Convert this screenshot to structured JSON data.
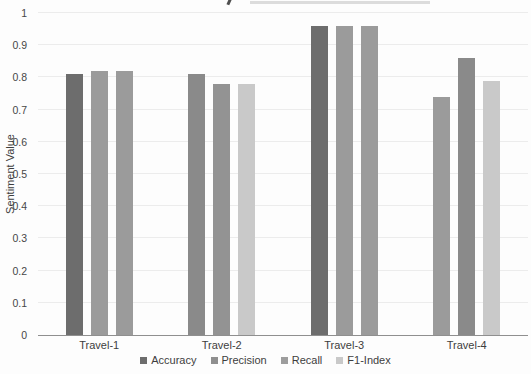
{
  "chart_data": {
    "type": "bar",
    "title": "",
    "title_note": "title cropped out of frame at top edge",
    "ylabel": "Sentiment Value",
    "xlabel": "",
    "ylim": [
      0,
      1
    ],
    "yticks": [
      0,
      0.1,
      0.2,
      0.3,
      0.4,
      0.5,
      0.6,
      0.7,
      0.8,
      0.9,
      1
    ],
    "grid": true,
    "legend_position": "bottom",
    "categories": [
      "Travel-1",
      "Travel-2",
      "Travel-3",
      "Travel-4"
    ],
    "series": [
      {
        "name": "Accuracy",
        "color": "#6d6d6d"
      },
      {
        "name": "Precision",
        "color": "#8f8f8f"
      },
      {
        "name": "Recall",
        "color": "#9d9d9d"
      },
      {
        "name": "F1-Index",
        "color": "#c9c9c9"
      }
    ],
    "groups": [
      {
        "category": "Travel-1",
        "bars": [
          {
            "value": 0.81,
            "color": "#6d6d6d"
          },
          {
            "value": 0.82,
            "color": "#9b9b9b"
          },
          {
            "value": 0.82,
            "color": "#9b9b9b"
          }
        ]
      },
      {
        "category": "Travel-2",
        "bars": [
          {
            "value": 0.81,
            "color": "#8a8a8a"
          },
          {
            "value": 0.78,
            "color": "#939393"
          },
          {
            "value": 0.78,
            "color": "#c9c9c9"
          }
        ]
      },
      {
        "category": "Travel-3",
        "bars": [
          {
            "value": 0.96,
            "color": "#6d6d6d"
          },
          {
            "value": 0.96,
            "color": "#9b9b9b"
          },
          {
            "value": 0.96,
            "color": "#9b9b9b"
          }
        ]
      },
      {
        "category": "Travel-4",
        "bars": [
          {
            "value": 0.74,
            "color": "#9b9b9b"
          },
          {
            "value": 0.86,
            "color": "#8a8a8a"
          },
          {
            "value": 0.79,
            "color": "#c9c9c9"
          }
        ]
      }
    ]
  },
  "colors": {
    "background": "#fdfdfd",
    "gridline": "#ececec",
    "axis_line": "#8f8f8f",
    "text": "#3d3d3d"
  }
}
